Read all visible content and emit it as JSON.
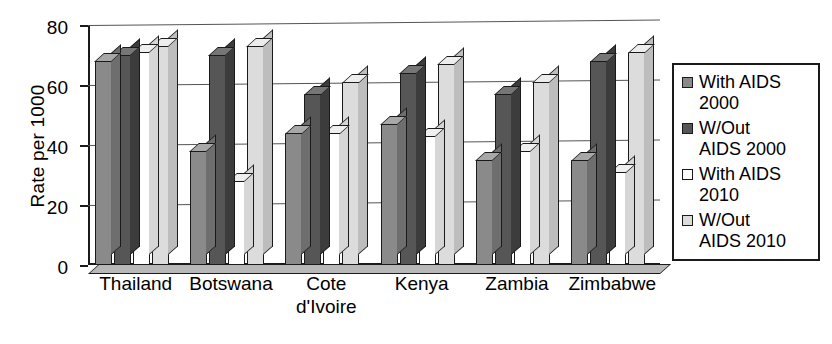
{
  "chart_data": {
    "type": "bar",
    "title": "",
    "xlabel": "",
    "ylabel": "Rate per 1000",
    "ylim": [
      0,
      80
    ],
    "yticks": [
      0,
      20,
      40,
      60,
      80
    ],
    "grid": true,
    "legend_position": "right",
    "categories": [
      "Thailand",
      "Botswana",
      "Cote\nd'Ivoire",
      "Kenya",
      "Zambia",
      "Zimbabwe"
    ],
    "series": [
      {
        "name": "With AIDS\n2000",
        "color": "#8a8a8a",
        "values": [
          68,
          38,
          44,
          47,
          35,
          35
        ]
      },
      {
        "name": "W/Out\nAIDS 2000",
        "color": "#565656",
        "values": [
          70,
          70,
          57,
          64,
          57,
          68
        ]
      },
      {
        "name": "With AIDS\n2010",
        "color": "#ffffff",
        "values": [
          71,
          28,
          44,
          43,
          38,
          31
        ]
      },
      {
        "name": "W/Out\nAIDS 2010",
        "color": "#dcdcdc",
        "values": [
          73,
          73,
          61,
          67,
          61,
          71
        ]
      }
    ]
  },
  "axis": {
    "y_title": "Rate per 1000",
    "tick_labels": [
      "80",
      "60",
      "40",
      "20",
      "0"
    ]
  },
  "legend": {
    "items": [
      {
        "label": "With AIDS\n2000"
      },
      {
        "label": "W/Out\nAIDS 2000"
      },
      {
        "label": "With AIDS\n2010"
      },
      {
        "label": "W/Out\nAIDS 2010"
      }
    ]
  }
}
